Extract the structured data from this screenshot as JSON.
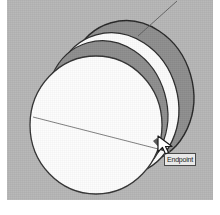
{
  "app": {
    "name": "3d-modeling-viewport",
    "title": "SketchUp modeling viewport"
  },
  "viewport": {
    "background_color": "#b6b6b6",
    "width": 206,
    "height": 200
  },
  "tooltip": {
    "name": "endpoint-inference-tooltip",
    "label": "Endpoint",
    "text_color": "#1b1b1b",
    "background_color": "#e9e9e9",
    "border_color": "#4a4a4a",
    "x": 164,
    "y": 153
  },
  "cursor": {
    "name": "pencil-cursor",
    "type": "line-tool-pencil",
    "x": 155,
    "y": 133
  },
  "geometry": {
    "description": "Three stacked circular faces forming a swept cylinder form seen in perspective",
    "shapes": [
      {
        "name": "back-circle-face",
        "role": "far-end-disc",
        "fill": "#8c8c8c",
        "stroke": "#2a2a2a",
        "center_x": 131,
        "center_y": 92,
        "radius_x": 62,
        "radius_y": 72,
        "rotation_deg": -16
      },
      {
        "name": "middle-circle-face",
        "role": "mid-disc-highlight",
        "fill": "#fcfcfc",
        "stroke": "#2a2a2a",
        "center_x": 116,
        "center_y": 104,
        "radius_x": 62,
        "radius_y": 72,
        "rotation_deg": -16
      },
      {
        "name": "mid-shadow-band",
        "role": "inner-shaded-disc",
        "fill": "#8c8c8c",
        "stroke": "#2a2a2a",
        "center_x": 107,
        "center_y": 110,
        "radius_x": 60,
        "radius_y": 70,
        "rotation_deg": -16
      },
      {
        "name": "front-circle-face",
        "role": "near-end-disc",
        "fill": "#fdfdfd",
        "stroke": "#333333",
        "center_x": 96,
        "center_y": 125,
        "radius_x": 66,
        "radius_y": 69,
        "rotation_deg": 0
      }
    ],
    "lines": [
      {
        "name": "diameter-guide-line",
        "role": "construction-chord-across-front-face",
        "stroke": "#6a6a6a",
        "x1": 33,
        "y1": 117,
        "x2": 167,
        "y2": 152
      },
      {
        "name": "leader-line",
        "role": "thin-edge-to-upper-right",
        "stroke": "#555555",
        "x1": 138,
        "y1": 36,
        "x2": 175,
        "y2": 2
      }
    ]
  },
  "colors": {
    "canvas_gray": "#b6b6b6",
    "shaded_gray": "#8c8c8c",
    "face_white": "#fcfcfc",
    "edge_black": "#2a2a2a",
    "page_white": "#ffffff"
  }
}
